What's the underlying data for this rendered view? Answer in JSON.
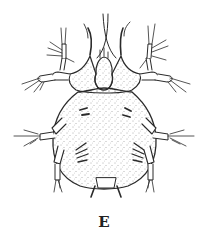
{
  "figure": {
    "label": "E",
    "colors": {
      "ink": "#2a2a2a",
      "background": "#ffffff",
      "stipple": "#555555"
    }
  }
}
